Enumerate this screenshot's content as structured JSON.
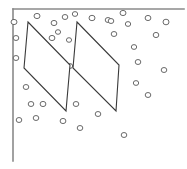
{
  "figure": {
    "width": 187,
    "height": 169,
    "background_color": "#ffffff",
    "stroke_color": "#3a3a3a",
    "frame_color": "#8a8a8a",
    "circle_stroke_color": "#5a5a5a",
    "circle_fill_color": "#ffffff",
    "stroke_width": 1.1,
    "frame_stroke_width": 1.6,
    "circle_stroke_width": 0.9
  },
  "frame": {
    "name": "l-shaped-border",
    "top_line": {
      "x1": 13,
      "y1": 9,
      "x2": 184,
      "y2": 9
    },
    "left_line": {
      "x1": 13,
      "y1": 9,
      "x2": 13,
      "y2": 161
    }
  },
  "shapes": [
    {
      "name": "left-parallelogram",
      "points": "28,22 70,65 66,111 24,68",
      "vertices": [
        {
          "x": 28,
          "y": 22
        },
        {
          "x": 70,
          "y": 65
        },
        {
          "x": 66,
          "y": 111
        },
        {
          "x": 24,
          "y": 68
        }
      ]
    },
    {
      "name": "right-parallelogram",
      "points": "77,22 119,65 116,111 73,68",
      "vertices": [
        {
          "x": 77,
          "y": 22
        },
        {
          "x": 119,
          "y": 65
        },
        {
          "x": 116,
          "y": 111
        },
        {
          "x": 73,
          "y": 68
        }
      ]
    }
  ],
  "circles": [
    {
      "cx": 14,
      "cy": 22,
      "rx": 3.0,
      "ry": 2.6
    },
    {
      "cx": 16,
      "cy": 38,
      "rx": 2.8,
      "ry": 2.5
    },
    {
      "cx": 16,
      "cy": 58,
      "rx": 2.8,
      "ry": 2.5
    },
    {
      "cx": 37,
      "cy": 16,
      "rx": 3.0,
      "ry": 2.6
    },
    {
      "cx": 54,
      "cy": 23,
      "rx": 2.9,
      "ry": 2.6
    },
    {
      "cx": 65,
      "cy": 17,
      "rx": 2.8,
      "ry": 2.5
    },
    {
      "cx": 75,
      "cy": 14,
      "rx": 2.7,
      "ry": 2.4
    },
    {
      "cx": 58,
      "cy": 32,
      "rx": 2.6,
      "ry": 2.3
    },
    {
      "cx": 52,
      "cy": 38,
      "rx": 2.9,
      "ry": 2.6
    },
    {
      "cx": 92,
      "cy": 18,
      "rx": 3.0,
      "ry": 2.7
    },
    {
      "cx": 108,
      "cy": 20,
      "rx": 2.8,
      "ry": 2.5
    },
    {
      "cx": 123,
      "cy": 13,
      "rx": 3.0,
      "ry": 2.6
    },
    {
      "cx": 111,
      "cy": 21,
      "rx": 2.8,
      "ry": 2.5
    },
    {
      "cx": 128,
      "cy": 24,
      "rx": 2.7,
      "ry": 2.4
    },
    {
      "cx": 148,
      "cy": 18,
      "rx": 2.9,
      "ry": 2.6
    },
    {
      "cx": 166,
      "cy": 22,
      "rx": 3.0,
      "ry": 2.8
    },
    {
      "cx": 156,
      "cy": 35,
      "rx": 2.8,
      "ry": 2.6
    },
    {
      "cx": 114,
      "cy": 34,
      "rx": 2.8,
      "ry": 2.5
    },
    {
      "cx": 134,
      "cy": 47,
      "rx": 2.7,
      "ry": 2.4
    },
    {
      "cx": 69,
      "cy": 40,
      "rx": 2.6,
      "ry": 2.3
    },
    {
      "cx": 138,
      "cy": 62,
      "rx": 2.8,
      "ry": 2.5
    },
    {
      "cx": 164,
      "cy": 70,
      "rx": 2.8,
      "ry": 2.5
    },
    {
      "cx": 136,
      "cy": 83,
      "rx": 2.7,
      "ry": 2.4
    },
    {
      "cx": 148,
      "cy": 95,
      "rx": 2.8,
      "ry": 2.5
    },
    {
      "cx": 70,
      "cy": 66,
      "rx": 2.7,
      "ry": 2.4
    },
    {
      "cx": 26,
      "cy": 87,
      "rx": 2.8,
      "ry": 2.5
    },
    {
      "cx": 31,
      "cy": 104,
      "rx": 2.8,
      "ry": 2.5
    },
    {
      "cx": 43,
      "cy": 104,
      "rx": 2.9,
      "ry": 2.6
    },
    {
      "cx": 19,
      "cy": 120,
      "rx": 2.8,
      "ry": 2.5
    },
    {
      "cx": 36,
      "cy": 118,
      "rx": 2.8,
      "ry": 2.5
    },
    {
      "cx": 76,
      "cy": 104,
      "rx": 2.8,
      "ry": 2.5
    },
    {
      "cx": 63,
      "cy": 121,
      "rx": 2.9,
      "ry": 2.6
    },
    {
      "cx": 80,
      "cy": 128,
      "rx": 2.8,
      "ry": 2.5
    },
    {
      "cx": 98,
      "cy": 114,
      "rx": 2.8,
      "ry": 2.5
    },
    {
      "cx": 124,
      "cy": 135,
      "rx": 2.8,
      "ry": 2.5
    }
  ]
}
